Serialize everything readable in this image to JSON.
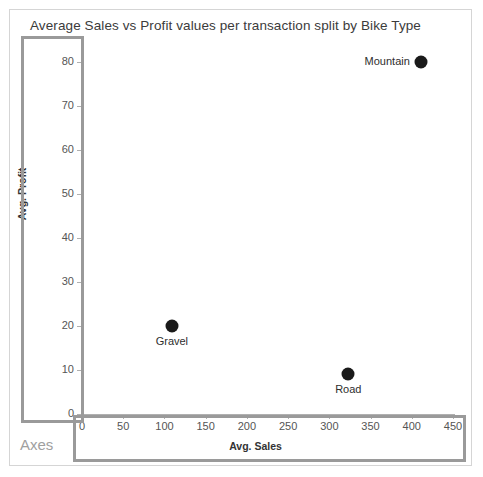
{
  "chart_data": {
    "type": "scatter",
    "title": "Average Sales vs Profit values per transaction split by Bike Type",
    "xlabel": "Avg. Sales",
    "ylabel": "Avg. Profit",
    "xlim": [
      0,
      480
    ],
    "ylim": [
      0,
      85
    ],
    "xticks": [
      0,
      50,
      100,
      150,
      200,
      250,
      300,
      350,
      400,
      450
    ],
    "yticks": [
      0,
      10,
      20,
      30,
      40,
      50,
      60,
      70,
      80
    ],
    "grid": false,
    "legend": "none",
    "point_color": "#1a1a1a",
    "points": [
      {
        "label": "Mountain",
        "x": 411,
        "y": 80,
        "label_position": "left"
      },
      {
        "label": "Gravel",
        "x": 109,
        "y": 20,
        "label_position": "below"
      },
      {
        "label": "Road",
        "x": 323,
        "y": 9,
        "label_position": "below"
      }
    ]
  },
  "annotations": {
    "axes_label": "Axes",
    "highlight_color": "#9a9a9a"
  }
}
